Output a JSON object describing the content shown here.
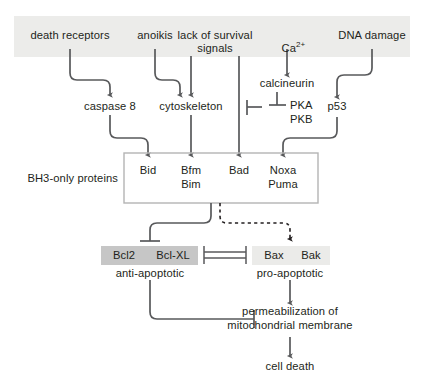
{
  "diagram": {
    "colors": {
      "banner_bg": "#ececea",
      "stroke": "#58595b",
      "box_stroke": "#b4b4b4",
      "anti_apoptotic_bg": "#c6c6c6",
      "pro_apoptotic_bg": "#ebebe9",
      "text": "#231f20",
      "page_bg": "#ffffff"
    },
    "stimuli": [
      {
        "id": "death-receptors",
        "label": "death receptors"
      },
      {
        "id": "anoikis",
        "label": "anoikis"
      },
      {
        "id": "lack-of-survival-signals",
        "label": "lack of survival",
        "label2": "signals"
      },
      {
        "id": "calcium",
        "label": "Ca",
        "superscript": "2+"
      },
      {
        "id": "dna-damage",
        "label": "DNA damage"
      }
    ],
    "mediators": [
      {
        "id": "caspase-8",
        "label": "caspase 8"
      },
      {
        "id": "cytoskeleton",
        "label": "cytoskeleton"
      },
      {
        "id": "calcineurin",
        "label": "calcineurin"
      },
      {
        "id": "pka",
        "label": "PKA"
      },
      {
        "id": "pkb",
        "label": "PKB"
      },
      {
        "id": "p53",
        "label": "p53"
      }
    ],
    "bh3_group": {
      "label": "BH3-only proteins",
      "members": [
        {
          "id": "bid",
          "line1": "Bid",
          "line2": ""
        },
        {
          "id": "bfm-bim",
          "line1": "Bfm",
          "line2": "Bim"
        },
        {
          "id": "bad",
          "line1": "Bad",
          "line2": ""
        },
        {
          "id": "noxa-puma",
          "line1": "Noxa",
          "line2": "Puma"
        }
      ]
    },
    "effectors": {
      "anti_apoptotic": {
        "id": "bcl2-bclxl",
        "member1": "Bcl2",
        "member2": "Bcl-XL",
        "caption": "anti-apoptotic"
      },
      "pro_apoptotic": {
        "id": "bax-bak",
        "member1": "Bax",
        "member2": "Bak",
        "caption": "pro-apoptotic"
      }
    },
    "outcomes": [
      {
        "id": "permeabilization",
        "line1": "permeabilization of",
        "line2": "mitochondrial membrane"
      },
      {
        "id": "cell-death",
        "line1": "cell death",
        "line2": ""
      }
    ]
  }
}
